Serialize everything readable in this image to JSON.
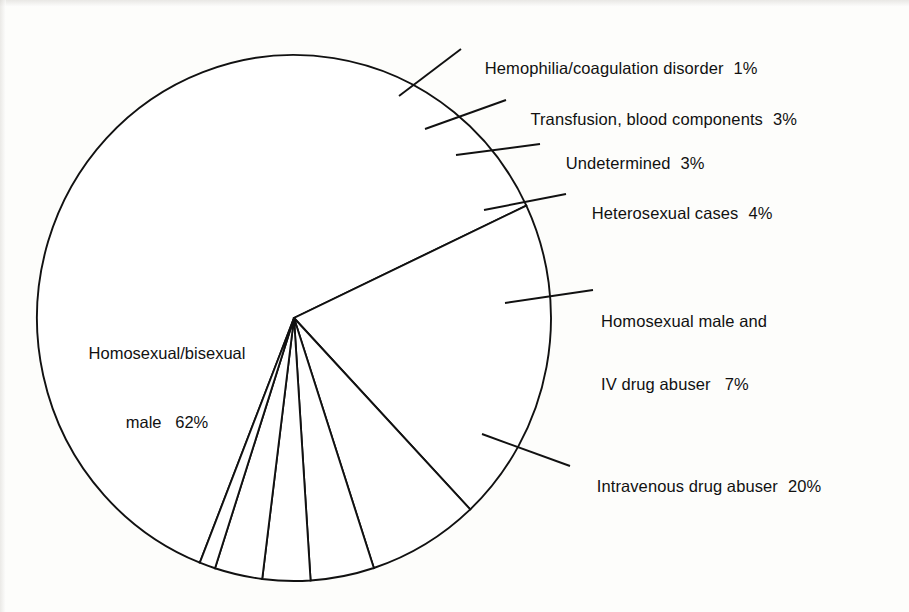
{
  "chart_data": {
    "type": "pie",
    "title": "",
    "subtitle": "",
    "xlabel": "",
    "ylabel": "",
    "legend_position": "callout-labels",
    "grid": false,
    "total_percent": 100,
    "units": "%",
    "categories": [
      "Homosexual/bisexual male",
      "Hemophilia/coagulation disorder",
      "Transfusion, blood components",
      "Undetermined",
      "Heterosexual cases",
      "Homosexual male and IV drug abuser",
      "Intravenous drug abuser"
    ],
    "values": [
      62,
      1,
      3,
      3,
      4,
      7,
      20
    ],
    "slices": [
      {
        "name": "Homosexual/bisexual male",
        "value": 62,
        "value_label": "62%",
        "label_line1": "Homosexual/bisexual",
        "label_line2": "male   62%",
        "label_placement": "inside"
      },
      {
        "name": "Hemophilia/coagulation disorder",
        "value": 1,
        "value_label": "1%",
        "label_text": "Hemophilia/coagulation disorder",
        "label_placement": "callout"
      },
      {
        "name": "Transfusion, blood components",
        "value": 3,
        "value_label": "3%",
        "label_text": "Transfusion, blood components",
        "label_placement": "callout"
      },
      {
        "name": "Undetermined",
        "value": 3,
        "value_label": "3%",
        "label_text": "Undetermined",
        "label_placement": "callout"
      },
      {
        "name": "Heterosexual cases",
        "value": 4,
        "value_label": "4%",
        "label_text": "Heterosexual cases",
        "label_placement": "callout"
      },
      {
        "name": "Homosexual male and IV drug abuser",
        "value": 7,
        "value_label": "7%",
        "label_line1": "Homosexual male and",
        "label_line2": "IV drug abuser   7%",
        "label_placement": "callout"
      },
      {
        "name": "Intravenous drug abuser",
        "value": 20,
        "value_label": "20%",
        "label_text": "Intravenous drug abuser",
        "label_placement": "callout"
      }
    ],
    "colors": {
      "slice_fill": "#ffffff",
      "outline": "#111111",
      "background": "#fdfdfb",
      "text": "#111111"
    }
  },
  "figure": {
    "alt_name": "pie-chart-aids-transmission-categories"
  }
}
